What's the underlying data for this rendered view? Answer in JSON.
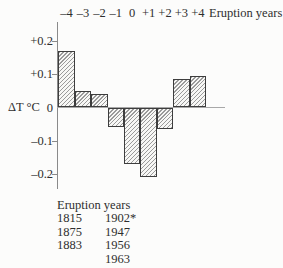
{
  "figure": {
    "top_axis": {
      "tick_labels": [
        "–4",
        "–3",
        "–2",
        "–1",
        "0",
        "+1",
        "+2",
        "+3",
        "+4"
      ],
      "title": "Eruption years"
    },
    "y_axis": {
      "label": "ΔT °C",
      "tick_labels": [
        "+0.2",
        "+0.1",
        "0",
        "–0.1",
        "–0.2"
      ],
      "tick_values": [
        0.2,
        0.1,
        0,
        -0.1,
        -0.2
      ]
    },
    "legend": {
      "title": "Eruption years",
      "column1": [
        "1815",
        "1875",
        "1883"
      ],
      "column2": [
        "1902*",
        "1947",
        "1956",
        "1963"
      ]
    }
  },
  "chart_data": {
    "type": "bar",
    "categories": [
      "-4",
      "-3",
      "-2",
      "-1",
      "0",
      "+1",
      "+2",
      "+3",
      "+4"
    ],
    "values": [
      0.17,
      0.05,
      0.04,
      -0.06,
      -0.17,
      -0.21,
      -0.065,
      0.085,
      0.095
    ],
    "title": "",
    "xlabel": "Eruption years",
    "ylabel": "ΔT °C",
    "ylim": [
      -0.25,
      0.26
    ],
    "yticks": [
      0.2,
      0.1,
      0,
      -0.1,
      -0.2
    ],
    "grid": false,
    "legend_position": "below",
    "bar_style": "diagonal-hatch"
  },
  "colors": {
    "background": "#fcfcfb",
    "text": "#2e2e2e",
    "axis": "#8a8a8a",
    "zero_line": "#a8a8a8",
    "bar_border": "#3d3d3d",
    "hatch_line": "#9a9a9a",
    "hatch_bg": "#f7f7f5"
  }
}
